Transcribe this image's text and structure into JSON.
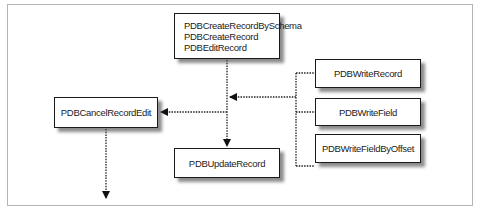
{
  "diagram": {
    "type": "flow",
    "nodes": [
      {
        "id": "create",
        "lines": [
          "PDBCreateRecordBySchema",
          "PDBCreateRecord",
          "PDBEditRecord"
        ]
      },
      {
        "id": "cancel",
        "label": "PDBCancelRecordEdit"
      },
      {
        "id": "update",
        "label": "PDBUpdateRecord"
      },
      {
        "id": "write_record",
        "label": "PDBWriteRecord"
      },
      {
        "id": "write_field",
        "label": "PDBWriteField"
      },
      {
        "id": "write_field_offset",
        "label": "PDBWriteFieldByOffset"
      }
    ],
    "edges": [
      {
        "from": "create",
        "to": "update",
        "style": "dotted"
      },
      {
        "from": "create",
        "to": "cancel",
        "style": "dotted"
      },
      {
        "from": "write_record",
        "to": "create-update-path",
        "style": "dotted"
      },
      {
        "from": "write_field",
        "to": "create-update-path",
        "style": "dotted"
      },
      {
        "from": "write_field_offset",
        "to": "create-update-path",
        "style": "dotted"
      },
      {
        "from": "cancel",
        "to": "exit",
        "style": "dotted"
      }
    ]
  },
  "colors": {
    "border": "#1a1a1a",
    "frame": "#b4b4b4",
    "line": "#222222"
  }
}
